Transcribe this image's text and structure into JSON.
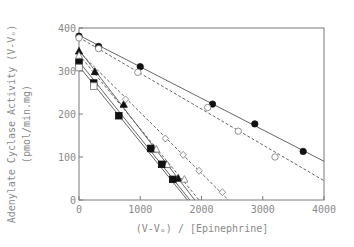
{
  "chart_data": {
    "type": "scatter",
    "title": "",
    "xlabel": "(V-Vo) / [Epinephrine]",
    "ylabel_line1": "Adenylate Cyclase Activity (V-Vo)",
    "ylabel_line2": "(pmol/min.mg)",
    "xlim": [
      0,
      4000
    ],
    "ylim": [
      0,
      400
    ],
    "xticks": [
      0,
      1000,
      2000,
      3000,
      4000
    ],
    "yticks": [
      0,
      100,
      200,
      300,
      400
    ],
    "grid": false,
    "legend": "none",
    "series": [
      {
        "name": "filled-circle",
        "marker": "circle",
        "filled": true,
        "line": "solid",
        "points": [
          [
            0,
            381
          ],
          [
            320,
            357
          ],
          [
            1000,
            310
          ],
          [
            2180,
            223
          ],
          [
            2870,
            177
          ],
          [
            3660,
            113
          ]
        ],
        "fit": [
          [
            0,
            383
          ],
          [
            4000,
            90
          ]
        ]
      },
      {
        "name": "open-circle",
        "marker": "circle",
        "filled": false,
        "line": "dashed",
        "points": [
          [
            0,
            377
          ],
          [
            320,
            352
          ],
          [
            960,
            297
          ],
          [
            2100,
            215
          ],
          [
            2600,
            160
          ],
          [
            3200,
            100
          ]
        ],
        "fit": [
          [
            0,
            378
          ],
          [
            4000,
            45
          ]
        ]
      },
      {
        "name": "filled-triangle",
        "marker": "triangle",
        "filled": true,
        "line": "solid",
        "points": [
          [
            0,
            346
          ],
          [
            260,
            298
          ],
          [
            730,
            222
          ],
          [
            1210,
            118
          ],
          [
            1420,
            82
          ],
          [
            1620,
            50
          ]
        ],
        "fit": [
          [
            0,
            349
          ],
          [
            1890,
            0
          ]
        ]
      },
      {
        "name": "open-triangle",
        "marker": "triangle",
        "filled": false,
        "line": "dashed",
        "points": [
          [
            0,
            336
          ],
          [
            1260,
            118
          ],
          [
            1440,
            82
          ],
          [
            1720,
            48
          ]
        ],
        "fit": [
          [
            0,
            338
          ],
          [
            1960,
            0
          ]
        ]
      },
      {
        "name": "filled-square",
        "marker": "square",
        "filled": true,
        "line": "solid",
        "points": [
          [
            0,
            320
          ],
          [
            240,
            272
          ],
          [
            650,
            196
          ],
          [
            1170,
            120
          ],
          [
            1350,
            83
          ],
          [
            1530,
            48
          ]
        ],
        "fit": [
          [
            0,
            322
          ],
          [
            1810,
            0
          ]
        ]
      },
      {
        "name": "open-square",
        "marker": "square",
        "filled": false,
        "line": "solid",
        "points": [
          [
            0,
            308
          ],
          [
            240,
            265
          ]
        ],
        "fit": [
          [
            0,
            311
          ],
          [
            1770,
            0
          ]
        ]
      },
      {
        "name": "open-diamond",
        "marker": "diamond",
        "filled": false,
        "line": "dashed",
        "points": [
          [
            760,
            234
          ],
          [
            1410,
            143
          ],
          [
            1700,
            105
          ],
          [
            1960,
            68
          ],
          [
            2340,
            18
          ]
        ],
        "fit": [
          [
            0,
            345
          ],
          [
            2440,
            0
          ]
        ]
      }
    ]
  },
  "labels": {
    "x_axis_title": "(V-Vₒ) / [Epinephrine]",
    "y_axis_title_1": "Adenylate Cyclase Activity (V-Vₒ)",
    "y_axis_title_2": "(pmol/min.mg)"
  }
}
